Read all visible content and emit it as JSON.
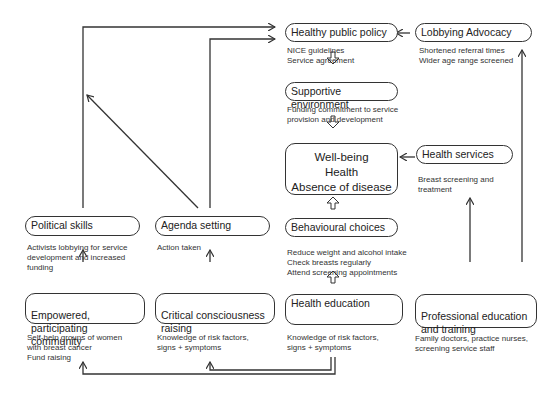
{
  "nodes": {
    "healthy_public_policy": {
      "title": "Healthy public policy",
      "desc": "NICE guidelines\nService agreement"
    },
    "lobbying_advocacy": {
      "title": "Lobbying Advocacy",
      "desc": "Shortened referral times\nWider age range screened"
    },
    "supportive_environment": {
      "title": "Supportive environment",
      "desc": "Funding commitment to service\nprovision and development"
    },
    "wellbeing": {
      "line1": "Well-being",
      "line2": "Health",
      "line3": "Absence of disease"
    },
    "health_services": {
      "title": "Health services",
      "desc": "Breast screening and\ntreatment"
    },
    "political_skills": {
      "title": "Political skills",
      "desc": "Activists lobbying for service\ndevelopment and increased\nfunding"
    },
    "agenda_setting": {
      "title": "Agenda setting",
      "desc": "Action taken"
    },
    "behavioural_choices": {
      "title": "Behavioural choices",
      "desc": "Reduce weight and alcohol intake\nCheck breasts regularly\nAttend screening appointments"
    },
    "empowered_community": {
      "title": "Empowered, participating\ncommunity",
      "desc": "Self-help groups of women\nwith breast cancer\nFund raising"
    },
    "critical_consciousness": {
      "title": "Critical consciousness\nraising",
      "desc": "Knowledge of risk factors,\nsigns + symptoms"
    },
    "health_education": {
      "title": "Health education",
      "desc": "Knowledge of risk factors,\nsigns + symptoms"
    },
    "professional_education": {
      "title": "Professional education\nand training",
      "desc": "Family doctors, practice nurses,\nscreening service staff"
    }
  }
}
